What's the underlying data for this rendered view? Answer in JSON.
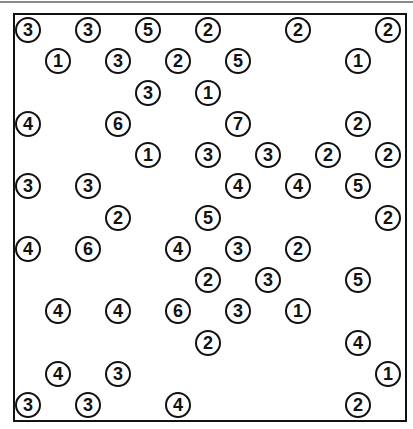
{
  "puzzle": {
    "type": "hashiwokakero",
    "rows": 13,
    "cols": 13,
    "colors": {
      "ink": "#111111",
      "background": "#ffffff",
      "top_rule": "#8a8a8a"
    },
    "islands": [
      {
        "row": 0,
        "col": 0,
        "value": "3"
      },
      {
        "row": 0,
        "col": 2,
        "value": "3"
      },
      {
        "row": 0,
        "col": 4,
        "value": "5"
      },
      {
        "row": 0,
        "col": 6,
        "value": "2"
      },
      {
        "row": 0,
        "col": 9,
        "value": "2"
      },
      {
        "row": 0,
        "col": 12,
        "value": "2"
      },
      {
        "row": 1,
        "col": 1,
        "value": "1"
      },
      {
        "row": 1,
        "col": 3,
        "value": "3"
      },
      {
        "row": 1,
        "col": 5,
        "value": "2"
      },
      {
        "row": 1,
        "col": 7,
        "value": "5"
      },
      {
        "row": 1,
        "col": 11,
        "value": "1"
      },
      {
        "row": 2,
        "col": 4,
        "value": "3"
      },
      {
        "row": 2,
        "col": 6,
        "value": "1"
      },
      {
        "row": 3,
        "col": 0,
        "value": "4"
      },
      {
        "row": 3,
        "col": 3,
        "value": "6"
      },
      {
        "row": 3,
        "col": 7,
        "value": "7"
      },
      {
        "row": 3,
        "col": 11,
        "value": "2"
      },
      {
        "row": 4,
        "col": 4,
        "value": "1"
      },
      {
        "row": 4,
        "col": 6,
        "value": "3"
      },
      {
        "row": 4,
        "col": 8,
        "value": "3"
      },
      {
        "row": 4,
        "col": 10,
        "value": "2"
      },
      {
        "row": 4,
        "col": 12,
        "value": "2"
      },
      {
        "row": 5,
        "col": 0,
        "value": "3"
      },
      {
        "row": 5,
        "col": 2,
        "value": "3"
      },
      {
        "row": 5,
        "col": 7,
        "value": "4"
      },
      {
        "row": 5,
        "col": 9,
        "value": "4"
      },
      {
        "row": 5,
        "col": 11,
        "value": "5"
      },
      {
        "row": 6,
        "col": 3,
        "value": "2"
      },
      {
        "row": 6,
        "col": 6,
        "value": "5"
      },
      {
        "row": 6,
        "col": 12,
        "value": "2"
      },
      {
        "row": 7,
        "col": 0,
        "value": "4"
      },
      {
        "row": 7,
        "col": 2,
        "value": "6"
      },
      {
        "row": 7,
        "col": 5,
        "value": "4"
      },
      {
        "row": 7,
        "col": 7,
        "value": "3"
      },
      {
        "row": 7,
        "col": 9,
        "value": "2"
      },
      {
        "row": 8,
        "col": 6,
        "value": "2"
      },
      {
        "row": 8,
        "col": 8,
        "value": "3"
      },
      {
        "row": 8,
        "col": 11,
        "value": "5"
      },
      {
        "row": 9,
        "col": 1,
        "value": "4"
      },
      {
        "row": 9,
        "col": 3,
        "value": "4"
      },
      {
        "row": 9,
        "col": 5,
        "value": "6"
      },
      {
        "row": 9,
        "col": 7,
        "value": "3"
      },
      {
        "row": 9,
        "col": 9,
        "value": "1"
      },
      {
        "row": 10,
        "col": 6,
        "value": "2"
      },
      {
        "row": 10,
        "col": 11,
        "value": "4"
      },
      {
        "row": 11,
        "col": 1,
        "value": "4"
      },
      {
        "row": 11,
        "col": 3,
        "value": "3"
      },
      {
        "row": 11,
        "col": 12,
        "value": "1"
      },
      {
        "row": 12,
        "col": 0,
        "value": "3"
      },
      {
        "row": 12,
        "col": 2,
        "value": "3"
      },
      {
        "row": 12,
        "col": 5,
        "value": "4"
      },
      {
        "row": 12,
        "col": 11,
        "value": "2"
      }
    ]
  }
}
